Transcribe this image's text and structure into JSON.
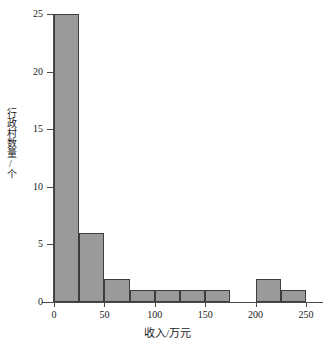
{
  "chart_data": {
    "type": "bar",
    "chart_subtype": "histogram",
    "title": "",
    "subtitle": "",
    "xlabel": "收入/万元",
    "ylabel": "行政村数量/个",
    "xlim": [
      0,
      250
    ],
    "ylim": [
      0,
      25
    ],
    "bin_width": 25,
    "grid": false,
    "legend": null,
    "legend_position": "none",
    "x_ticks": [
      "0",
      "50",
      "100",
      "150",
      "200",
      "250"
    ],
    "x_tick_values": [
      0,
      50,
      100,
      150,
      200,
      250
    ],
    "y_ticks": [
      "0",
      "5",
      "10",
      "15",
      "20",
      "25"
    ],
    "y_tick_values": [
      0,
      5,
      10,
      15,
      20,
      25
    ],
    "bin_edges": [
      0,
      25,
      50,
      75,
      100,
      125,
      150,
      175,
      200,
      225,
      250
    ],
    "categories": [
      "0-25",
      "25-50",
      "50-75",
      "75-100",
      "100-125",
      "125-150",
      "150-175",
      "175-200",
      "200-225",
      "225-250"
    ],
    "values": [
      25,
      6,
      2,
      1,
      1,
      1,
      1,
      0,
      2,
      1
    ],
    "bar_fill_color": "#9a9a9a",
    "bar_edge_color": "#3d3d3d",
    "axis_color": "#4a4a4a",
    "background_color": "#ffffff"
  }
}
